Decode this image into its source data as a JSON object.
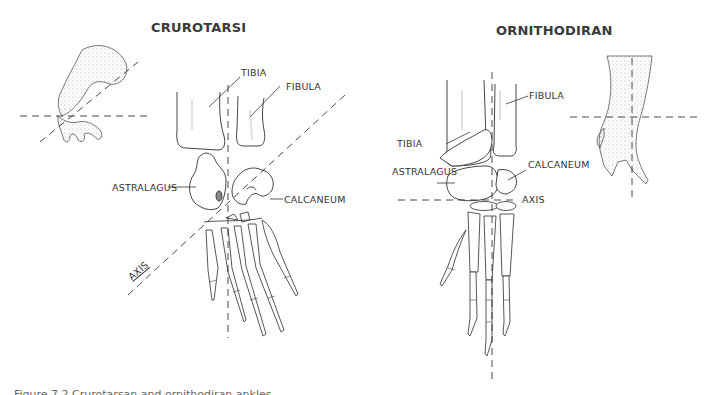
{
  "panels": {
    "left": {
      "title": "CRUROTARSI",
      "labels": {
        "tibia": "TIBIA",
        "fibula": "FIBULA",
        "astralagus": "ASTRALAGUS",
        "calcaneum": "CALCANEUM",
        "axis": "AXIS"
      }
    },
    "right": {
      "title": "ORNITHODIRAN",
      "labels": {
        "tibia": "TIBIA",
        "fibula": "FIBULA",
        "astralagus": "ASTRALAGUS",
        "calcaneum": "CALCANEUM",
        "axis": "AXIS"
      }
    }
  },
  "caption": {
    "text": "Figure 7.2 Crurotarsan and ornithodiran ankles"
  },
  "colors": {
    "line": "#444444",
    "shade": "#bbbbbb",
    "background": "#ffffff"
  }
}
